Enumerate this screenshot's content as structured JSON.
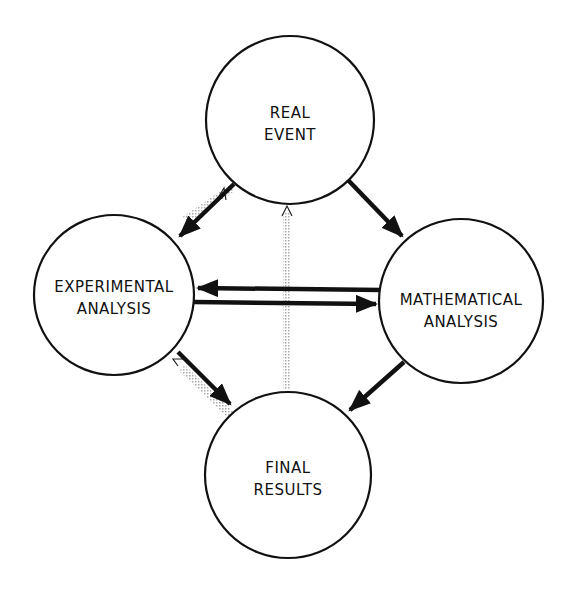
{
  "diagram": {
    "nodes": [
      {
        "id": "real-event",
        "line1": "REAL",
        "line2": "EVENT"
      },
      {
        "id": "experimental-analysis",
        "line1": "EXPERIMENTAL",
        "line2": "ANALYSIS"
      },
      {
        "id": "mathematical-analysis",
        "line1": "MATHEMATICAL",
        "line2": "ANALYSIS"
      },
      {
        "id": "final-results",
        "line1": "FINAL",
        "line2": "RESULTS"
      }
    ],
    "edges": [
      {
        "from": "real-event",
        "to": "experimental-analysis",
        "style": "solid"
      },
      {
        "from": "real-event",
        "to": "mathematical-analysis",
        "style": "solid"
      },
      {
        "from": "mathematical-analysis",
        "to": "experimental-analysis",
        "style": "solid"
      },
      {
        "from": "experimental-analysis",
        "to": "mathematical-analysis",
        "style": "solid"
      },
      {
        "from": "experimental-analysis",
        "to": "final-results",
        "style": "solid"
      },
      {
        "from": "mathematical-analysis",
        "to": "final-results",
        "style": "solid"
      },
      {
        "from": "experimental-analysis",
        "to": "real-event",
        "style": "dotted-feedback"
      },
      {
        "from": "final-results",
        "to": "real-event",
        "style": "dotted-feedback"
      },
      {
        "from": "final-results",
        "to": "experimental-analysis",
        "style": "dotted-feedback"
      }
    ]
  }
}
